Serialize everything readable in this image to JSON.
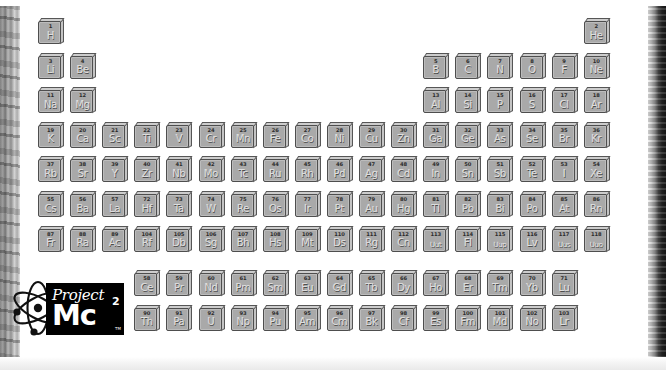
{
  "app": {
    "title": "Project Mc2 Periodic Table",
    "background_color": "#ffffff"
  },
  "frame": {
    "left_border_color": "#8a8a8a",
    "right_border_color": "#1a1a1a",
    "bottom_border_color": "#e9e9e9"
  },
  "logo": {
    "word_project": "Project",
    "word_mc": "Mc",
    "superscript": "2",
    "trademark": "TM",
    "atom_icon": "atom-icon",
    "box_color": "#000000",
    "text_color": "#ffffff"
  },
  "table": {
    "tile_face_color": "#a9a9a9",
    "tile_outline_color": "#4e4e4e",
    "symbol_color": "#dedede",
    "number_color": "#2c2c2c",
    "columns": 18,
    "main_rows": 7,
    "elements": [
      {
        "n": "1",
        "s": "H",
        "g": 1,
        "r": 1
      },
      {
        "n": "2",
        "s": "He",
        "g": 18,
        "r": 1
      },
      {
        "n": "3",
        "s": "Li",
        "g": 1,
        "r": 2
      },
      {
        "n": "4",
        "s": "Be",
        "g": 2,
        "r": 2
      },
      {
        "n": "5",
        "s": "B",
        "g": 13,
        "r": 2
      },
      {
        "n": "6",
        "s": "C",
        "g": 14,
        "r": 2
      },
      {
        "n": "7",
        "s": "N",
        "g": 15,
        "r": 2
      },
      {
        "n": "8",
        "s": "O",
        "g": 16,
        "r": 2
      },
      {
        "n": "9",
        "s": "F",
        "g": 17,
        "r": 2
      },
      {
        "n": "10",
        "s": "Ne",
        "g": 18,
        "r": 2
      },
      {
        "n": "11",
        "s": "Na",
        "g": 1,
        "r": 3
      },
      {
        "n": "12",
        "s": "Mg",
        "g": 2,
        "r": 3
      },
      {
        "n": "13",
        "s": "Al",
        "g": 13,
        "r": 3
      },
      {
        "n": "14",
        "s": "Si",
        "g": 14,
        "r": 3
      },
      {
        "n": "15",
        "s": "P",
        "g": 15,
        "r": 3
      },
      {
        "n": "16",
        "s": "S",
        "g": 16,
        "r": 3
      },
      {
        "n": "17",
        "s": "Cl",
        "g": 17,
        "r": 3
      },
      {
        "n": "18",
        "s": "Ar",
        "g": 18,
        "r": 3
      },
      {
        "n": "19",
        "s": "K",
        "g": 1,
        "r": 4
      },
      {
        "n": "20",
        "s": "Ca",
        "g": 2,
        "r": 4
      },
      {
        "n": "21",
        "s": "Sc",
        "g": 3,
        "r": 4
      },
      {
        "n": "22",
        "s": "Ti",
        "g": 4,
        "r": 4
      },
      {
        "n": "23",
        "s": "V",
        "g": 5,
        "r": 4
      },
      {
        "n": "24",
        "s": "Cr",
        "g": 6,
        "r": 4
      },
      {
        "n": "25",
        "s": "Mn",
        "g": 7,
        "r": 4
      },
      {
        "n": "26",
        "s": "Fe",
        "g": 8,
        "r": 4
      },
      {
        "n": "27",
        "s": "Co",
        "g": 9,
        "r": 4
      },
      {
        "n": "28",
        "s": "Ni",
        "g": 10,
        "r": 4
      },
      {
        "n": "29",
        "s": "Cu",
        "g": 11,
        "r": 4
      },
      {
        "n": "30",
        "s": "Zn",
        "g": 12,
        "r": 4
      },
      {
        "n": "31",
        "s": "Ga",
        "g": 13,
        "r": 4
      },
      {
        "n": "32",
        "s": "Ge",
        "g": 14,
        "r": 4
      },
      {
        "n": "33",
        "s": "As",
        "g": 15,
        "r": 4
      },
      {
        "n": "34",
        "s": "Se",
        "g": 16,
        "r": 4
      },
      {
        "n": "35",
        "s": "Br",
        "g": 17,
        "r": 4
      },
      {
        "n": "36",
        "s": "Kr",
        "g": 18,
        "r": 4
      },
      {
        "n": "37",
        "s": "Rb",
        "g": 1,
        "r": 5
      },
      {
        "n": "38",
        "s": "Sr",
        "g": 2,
        "r": 5
      },
      {
        "n": "39",
        "s": "Y",
        "g": 3,
        "r": 5
      },
      {
        "n": "40",
        "s": "Zr",
        "g": 4,
        "r": 5
      },
      {
        "n": "41",
        "s": "Nb",
        "g": 5,
        "r": 5
      },
      {
        "n": "42",
        "s": "Mo",
        "g": 6,
        "r": 5
      },
      {
        "n": "43",
        "s": "Tc",
        "g": 7,
        "r": 5
      },
      {
        "n": "44",
        "s": "Ru",
        "g": 8,
        "r": 5
      },
      {
        "n": "45",
        "s": "Rh",
        "g": 9,
        "r": 5
      },
      {
        "n": "46",
        "s": "Pd",
        "g": 10,
        "r": 5
      },
      {
        "n": "47",
        "s": "Ag",
        "g": 11,
        "r": 5
      },
      {
        "n": "48",
        "s": "Cd",
        "g": 12,
        "r": 5
      },
      {
        "n": "49",
        "s": "In",
        "g": 13,
        "r": 5
      },
      {
        "n": "50",
        "s": "Sn",
        "g": 14,
        "r": 5
      },
      {
        "n": "51",
        "s": "Sb",
        "g": 15,
        "r": 5
      },
      {
        "n": "52",
        "s": "Te",
        "g": 16,
        "r": 5
      },
      {
        "n": "53",
        "s": "I",
        "g": 17,
        "r": 5
      },
      {
        "n": "54",
        "s": "Xe",
        "g": 18,
        "r": 5
      },
      {
        "n": "55",
        "s": "Cs",
        "g": 1,
        "r": 6
      },
      {
        "n": "56",
        "s": "Ba",
        "g": 2,
        "r": 6
      },
      {
        "n": "57",
        "s": "La",
        "g": 3,
        "r": 6
      },
      {
        "n": "72",
        "s": "Hf",
        "g": 4,
        "r": 6
      },
      {
        "n": "73",
        "s": "Ta",
        "g": 5,
        "r": 6
      },
      {
        "n": "74",
        "s": "W",
        "g": 6,
        "r": 6
      },
      {
        "n": "75",
        "s": "Re",
        "g": 7,
        "r": 6
      },
      {
        "n": "76",
        "s": "Os",
        "g": 8,
        "r": 6
      },
      {
        "n": "77",
        "s": "Ir",
        "g": 9,
        "r": 6
      },
      {
        "n": "78",
        "s": "Pt",
        "g": 10,
        "r": 6
      },
      {
        "n": "79",
        "s": "Au",
        "g": 11,
        "r": 6
      },
      {
        "n": "80",
        "s": "Hg",
        "g": 12,
        "r": 6
      },
      {
        "n": "81",
        "s": "Tl",
        "g": 13,
        "r": 6
      },
      {
        "n": "82",
        "s": "Pb",
        "g": 14,
        "r": 6
      },
      {
        "n": "83",
        "s": "Bi",
        "g": 15,
        "r": 6
      },
      {
        "n": "84",
        "s": "Po",
        "g": 16,
        "r": 6
      },
      {
        "n": "85",
        "s": "At",
        "g": 17,
        "r": 6
      },
      {
        "n": "86",
        "s": "Rn",
        "g": 18,
        "r": 6
      },
      {
        "n": "87",
        "s": "Fr",
        "g": 1,
        "r": 7
      },
      {
        "n": "88",
        "s": "Ra",
        "g": 2,
        "r": 7
      },
      {
        "n": "89",
        "s": "Ac",
        "g": 3,
        "r": 7
      },
      {
        "n": "104",
        "s": "Rf",
        "g": 4,
        "r": 7
      },
      {
        "n": "105",
        "s": "Db",
        "g": 5,
        "r": 7
      },
      {
        "n": "106",
        "s": "Sg",
        "g": 6,
        "r": 7
      },
      {
        "n": "107",
        "s": "Bh",
        "g": 7,
        "r": 7
      },
      {
        "n": "108",
        "s": "Hs",
        "g": 8,
        "r": 7
      },
      {
        "n": "109",
        "s": "Mt",
        "g": 9,
        "r": 7
      },
      {
        "n": "110",
        "s": "Ds",
        "g": 10,
        "r": 7
      },
      {
        "n": "111",
        "s": "Rg",
        "g": 11,
        "r": 7
      },
      {
        "n": "112",
        "s": "Cn",
        "g": 12,
        "r": 7
      },
      {
        "n": "113",
        "s": "Uut",
        "g": 13,
        "r": 7
      },
      {
        "n": "114",
        "s": "Fl",
        "g": 14,
        "r": 7
      },
      {
        "n": "115",
        "s": "Uup",
        "g": 15,
        "r": 7
      },
      {
        "n": "116",
        "s": "Lv",
        "g": 16,
        "r": 7
      },
      {
        "n": "117",
        "s": "Uus",
        "g": 17,
        "r": 7
      },
      {
        "n": "118",
        "s": "Uuo",
        "g": 18,
        "r": 7
      },
      {
        "n": "58",
        "s": "Ce",
        "g": 4,
        "r": 9
      },
      {
        "n": "59",
        "s": "Pr",
        "g": 5,
        "r": 9
      },
      {
        "n": "60",
        "s": "Nd",
        "g": 6,
        "r": 9
      },
      {
        "n": "61",
        "s": "Pm",
        "g": 7,
        "r": 9
      },
      {
        "n": "62",
        "s": "Sm",
        "g": 8,
        "r": 9
      },
      {
        "n": "63",
        "s": "Eu",
        "g": 9,
        "r": 9
      },
      {
        "n": "64",
        "s": "Gd",
        "g": 10,
        "r": 9
      },
      {
        "n": "65",
        "s": "Tb",
        "g": 11,
        "r": 9
      },
      {
        "n": "66",
        "s": "Dy",
        "g": 12,
        "r": 9
      },
      {
        "n": "67",
        "s": "Ho",
        "g": 13,
        "r": 9
      },
      {
        "n": "68",
        "s": "Er",
        "g": 14,
        "r": 9
      },
      {
        "n": "69",
        "s": "Tm",
        "g": 15,
        "r": 9
      },
      {
        "n": "70",
        "s": "Yb",
        "g": 16,
        "r": 9
      },
      {
        "n": "71",
        "s": "Lu",
        "g": 17,
        "r": 9
      },
      {
        "n": "90",
        "s": "Th",
        "g": 4,
        "r": 10
      },
      {
        "n": "91",
        "s": "Pa",
        "g": 5,
        "r": 10
      },
      {
        "n": "92",
        "s": "U",
        "g": 6,
        "r": 10
      },
      {
        "n": "93",
        "s": "Np",
        "g": 7,
        "r": 10
      },
      {
        "n": "94",
        "s": "Pu",
        "g": 8,
        "r": 10
      },
      {
        "n": "95",
        "s": "Am",
        "g": 9,
        "r": 10
      },
      {
        "n": "96",
        "s": "Cm",
        "g": 10,
        "r": 10
      },
      {
        "n": "97",
        "s": "Bk",
        "g": 11,
        "r": 10
      },
      {
        "n": "98",
        "s": "Cf",
        "g": 12,
        "r": 10
      },
      {
        "n": "99",
        "s": "Es",
        "g": 13,
        "r": 10
      },
      {
        "n": "100",
        "s": "Fm",
        "g": 14,
        "r": 10
      },
      {
        "n": "101",
        "s": "Md",
        "g": 15,
        "r": 10
      },
      {
        "n": "102",
        "s": "No",
        "g": 16,
        "r": 10
      },
      {
        "n": "103",
        "s": "Lr",
        "g": 17,
        "r": 10
      }
    ]
  }
}
